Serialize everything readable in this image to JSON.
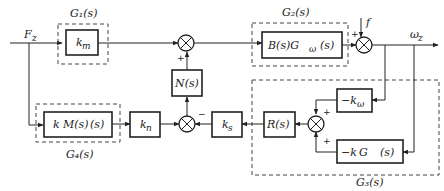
{
  "diagram": {
    "signals": {
      "input": "F",
      "input_sub": "z",
      "output": "ω",
      "output_sub": "z",
      "disturbance": "f"
    },
    "groups": {
      "g1": "G₁(s)",
      "g2": "G₂(s)",
      "g3": "G₃(s)",
      "g4": "G₄(s)"
    },
    "blocks": {
      "km": "k",
      "km_sub": "m",
      "B": "B(s)G",
      "B_sub": "ω",
      "B_tail": "(s)",
      "N": "N(s)",
      "kpM": "k",
      "kpM_mid": "M(s)",
      "kpM_tail": "(s)",
      "kn": "k",
      "kn_sub": "n",
      "ks": "k",
      "ks_sub": "s",
      "R": "R(s)",
      "kw": "−k",
      "kw_sub": "ω",
      "kwG": "−k",
      "kwG_mid": "G",
      "kwG_tail": "(s)"
    },
    "signs": {
      "sum1_bottom": "+",
      "sum2_top": "+",
      "sum3_top": "−",
      "sum4_top": "+",
      "sum4_bottom": "+"
    },
    "colors": {
      "line": "#222222",
      "background": "#ffffff"
    }
  }
}
